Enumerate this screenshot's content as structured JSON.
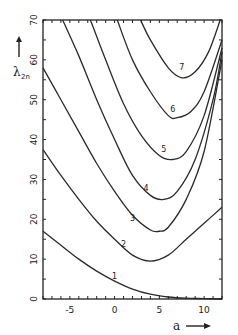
{
  "chart_data": {
    "type": "line",
    "title": "",
    "xlabel": "a",
    "ylabel": "λ2n",
    "xlim": [
      -8,
      12
    ],
    "ylim": [
      0,
      70
    ],
    "x_ticks": [
      -5,
      0,
      5,
      10
    ],
    "y_ticks": [
      0,
      10,
      20,
      30,
      40,
      50,
      60,
      70
    ],
    "grid": false,
    "legend": "inline curve labels",
    "series": [
      {
        "name": "1",
        "label_at": [
          0,
          5
        ],
        "points": [
          [
            -8,
            17
          ],
          [
            -6,
            13.5
          ],
          [
            -4,
            10
          ],
          [
            -2,
            7
          ],
          [
            0,
            4.5
          ],
          [
            2,
            2.5
          ],
          [
            4,
            1.2
          ],
          [
            6,
            0.5
          ],
          [
            8,
            0.2
          ],
          [
            10,
            0.1
          ],
          [
            12,
            0
          ]
        ]
      },
      {
        "name": "2",
        "label_at": [
          1,
          13
        ],
        "points": [
          [
            -8,
            37.5
          ],
          [
            -6,
            31
          ],
          [
            -4,
            25
          ],
          [
            -2,
            19.5
          ],
          [
            0,
            15
          ],
          [
            2,
            11
          ],
          [
            4,
            9.5
          ],
          [
            6,
            11
          ],
          [
            8,
            15
          ],
          [
            10,
            19
          ],
          [
            12,
            23
          ]
        ]
      },
      {
        "name": "3",
        "label_at": [
          2,
          19.5
        ],
        "points": [
          [
            -8,
            58
          ],
          [
            -6,
            50
          ],
          [
            -4,
            42
          ],
          [
            -2,
            34
          ],
          [
            0,
            27
          ],
          [
            2,
            21
          ],
          [
            4,
            17.3
          ],
          [
            5,
            17
          ],
          [
            6,
            18
          ],
          [
            8,
            25
          ],
          [
            10,
            37
          ],
          [
            12,
            60
          ]
        ]
      },
      {
        "name": "4",
        "label_at": [
          3.5,
          27
        ],
        "points": [
          [
            -5.8,
            70
          ],
          [
            -4,
            61
          ],
          [
            -2,
            50
          ],
          [
            0,
            40
          ],
          [
            2,
            31
          ],
          [
            4,
            26
          ],
          [
            5.5,
            25
          ],
          [
            7,
            27
          ],
          [
            9,
            35
          ],
          [
            11,
            50
          ],
          [
            12,
            62
          ]
        ]
      },
      {
        "name": "5",
        "label_at": [
          5.5,
          37
        ],
        "points": [
          [
            -2.7,
            70
          ],
          [
            -1,
            60
          ],
          [
            1,
            49
          ],
          [
            3,
            41
          ],
          [
            5,
            36
          ],
          [
            6.5,
            35
          ],
          [
            8,
            37
          ],
          [
            10,
            46
          ],
          [
            12,
            63
          ]
        ]
      },
      {
        "name": "6",
        "label_at": [
          6.5,
          47
        ],
        "points": [
          [
            0.3,
            70
          ],
          [
            2,
            60
          ],
          [
            4,
            52
          ],
          [
            6,
            46
          ],
          [
            7,
            45.5
          ],
          [
            8.5,
            47
          ],
          [
            10,
            52
          ],
          [
            12,
            65
          ]
        ]
      },
      {
        "name": "7",
        "label_at": [
          7.5,
          57.5
        ],
        "points": [
          [
            2.9,
            70
          ],
          [
            4,
            65
          ],
          [
            6,
            58
          ],
          [
            7.5,
            55.5
          ],
          [
            9,
            57
          ],
          [
            10.5,
            62
          ],
          [
            11.8,
            70
          ]
        ]
      }
    ]
  },
  "axes": {
    "x_label": "a",
    "x_arrow": "→",
    "y_label_main": "λ",
    "y_label_sub": "2n",
    "y_arrow": "↑",
    "x_tick_labels": [
      "-5",
      "0",
      "5",
      "10"
    ],
    "y_tick_labels": [
      "0",
      "10",
      "20",
      "30",
      "40",
      "50",
      "60",
      "70"
    ]
  }
}
